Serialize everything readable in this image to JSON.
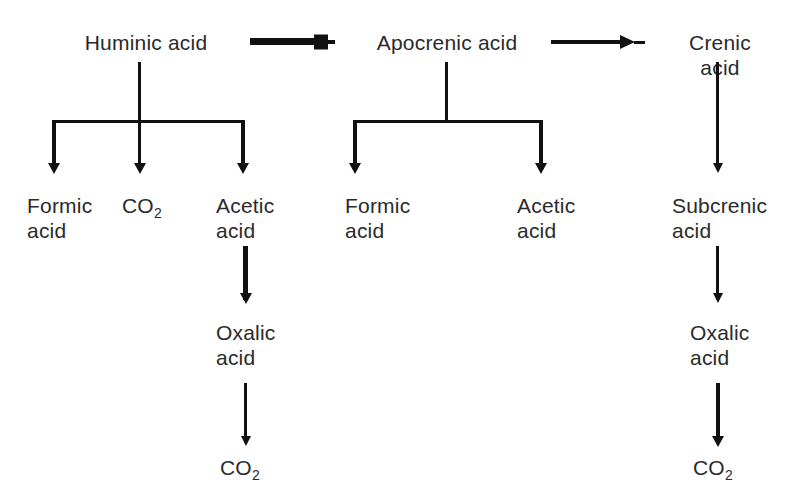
{
  "figure": {
    "type": "flow-diagram",
    "background_color": "#ffffff",
    "ink_color": "#111111",
    "text_color": "#2a2a2a"
  },
  "nodes": {
    "huminic_acid": "Huminic acid",
    "apocrenic_acid": "Apocrenic acid",
    "crenic_acid": "Crenic acid",
    "formic_acid_left": "Formic\nacid",
    "co2_left_branch": "CO",
    "co2_left_branch_sub": "2",
    "acetic_acid_left": "Acetic\nacid",
    "formic_acid_mid": "Formic\nacid",
    "acetic_acid_mid": "Acetic\nacid",
    "subcrenic_acid": "Subcrenic\nacid",
    "oxalic_acid_left": "Oxalic\nacid",
    "oxalic_acid_right": "Oxalic\nacid",
    "co2_bottom_left": "CO",
    "co2_bottom_left_sub": "2",
    "co2_bottom_right": "CO",
    "co2_bottom_right_sub": "2"
  },
  "edges": [
    {
      "from": "Huminic acid",
      "to": "Apocrenic acid",
      "direction": "right",
      "style": "thick"
    },
    {
      "from": "Apocrenic acid",
      "to": "Crenic acid",
      "direction": "right",
      "style": "thin"
    },
    {
      "from": "Huminic acid",
      "to": "Formic acid",
      "direction": "down"
    },
    {
      "from": "Huminic acid",
      "to": "CO2",
      "direction": "down"
    },
    {
      "from": "Huminic acid",
      "to": "Acetic acid",
      "direction": "down"
    },
    {
      "from": "Apocrenic acid",
      "to": "Formic acid",
      "direction": "down"
    },
    {
      "from": "Apocrenic acid",
      "to": "Acetic acid",
      "direction": "down"
    },
    {
      "from": "Crenic acid",
      "to": "Subcrenic acid",
      "direction": "down"
    },
    {
      "from": "Acetic acid",
      "to": "Oxalic acid",
      "direction": "down"
    },
    {
      "from": "Oxalic acid",
      "to": "CO2",
      "direction": "down"
    },
    {
      "from": "Subcrenic acid",
      "to": "Oxalic acid",
      "direction": "down"
    },
    {
      "from": "Oxalic acid",
      "to": "CO2",
      "direction": "down"
    }
  ]
}
